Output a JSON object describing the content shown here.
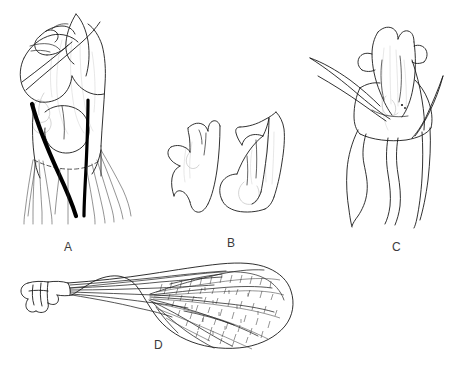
{
  "figure": {
    "type": "scientific-line-drawing-plate",
    "background_color": "#ffffff",
    "ink_color": "#1a1a1a",
    "ghost_color": "#c2c2c2",
    "width": 453,
    "height": 371,
    "panel_count": 4
  },
  "panels": [
    {
      "label": "A",
      "label_x": 64,
      "label_y": 240,
      "subject": "male genitalia, lateral view with paired sclerotized rods and setal fringe",
      "features": [
        "bold black sclerotized rod, left, curving down-right",
        "bold black sclerotized rod, right, nearly vertical",
        "dashed transverse membrane line",
        "setal fringe of thin hairs along lower margin",
        "pale ghost outlines of underlying structures"
      ]
    },
    {
      "label": "B",
      "label_x": 227,
      "label_y": 236,
      "subject": "two paramere outlines, left and right",
      "features": [
        "left paramere, serrate dorsal margin",
        "right paramere, elongate with hooked apex"
      ]
    },
    {
      "label": "C",
      "label_x": 392,
      "label_y": 240,
      "subject": "genitalia, ventral view with paired apical spines",
      "features": [
        "long tapering spine projecting to the left",
        "second spine projecting to the right",
        "four wavy descending processes",
        "pale ghost outlines of underlying structures"
      ]
    },
    {
      "label": "D",
      "label_x": 154,
      "label_y": 338,
      "subject": "wing, showing venation and basal articulation",
      "features": [
        "basal articulation sclerites",
        "longitudinal veins in narrow basal stalk",
        "reticulate cross-vein mesh in expanded distal half",
        "rounded apical margin"
      ]
    }
  ]
}
